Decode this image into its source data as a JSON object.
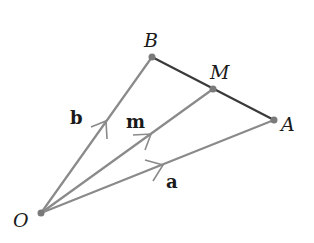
{
  "diagram": {
    "type": "vector-triangle",
    "points": {
      "O": {
        "label": "O",
        "x": 41,
        "y": 213
      },
      "A": {
        "label": "A",
        "x": 274,
        "y": 120
      },
      "B": {
        "label": "B",
        "x": 152,
        "y": 57
      },
      "M": {
        "label": "M",
        "x": 213,
        "y": 89
      }
    },
    "vectors": [
      {
        "name": "a",
        "label": "a",
        "from": "O",
        "to": "A"
      },
      {
        "name": "b",
        "label": "b",
        "from": "O",
        "to": "B"
      },
      {
        "name": "m",
        "label": "m",
        "from": "O",
        "to": "M"
      }
    ],
    "segments": [
      {
        "from": "B",
        "to": "A",
        "label": ""
      }
    ],
    "colors": {
      "vector_line": "#8a8a8a",
      "segment_line": "#3a3a3a",
      "point": "#7a7a7a",
      "text": "#1a1a1a"
    }
  }
}
